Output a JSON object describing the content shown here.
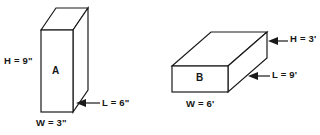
{
  "figure": {
    "background_color": "#ffffff",
    "line_color": "#1a1a1a"
  },
  "shapes": [
    {
      "id": "box-a",
      "letter": "A",
      "orientation": "tall-narrow-upright",
      "labels": {
        "height": "H = 9\"",
        "width": "W = 3\"",
        "length": "L = 6\""
      },
      "dimensions": {
        "height_value": 9,
        "width_value": 3,
        "length_value": 6,
        "unit": "inches",
        "unit_symbol": "\""
      }
    },
    {
      "id": "box-b",
      "letter": "B",
      "orientation": "wide-flat-horizontal",
      "labels": {
        "height": "H = 3'",
        "width": "W = 6'",
        "length": "L = 9'"
      },
      "dimensions": {
        "height_value": 3,
        "width_value": 6,
        "length_value": 9,
        "unit": "feet",
        "unit_symbol": "'"
      }
    }
  ]
}
